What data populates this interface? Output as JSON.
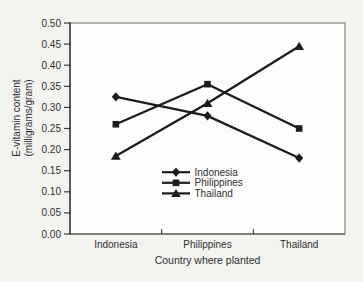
{
  "chart_data": {
    "type": "line",
    "title": "",
    "categories": [
      "Indonesia",
      "Philippines",
      "Thailand"
    ],
    "series": [
      {
        "name": "Indonesia",
        "marker": "diamond",
        "values": [
          0.325,
          0.28,
          0.18
        ]
      },
      {
        "name": "Philippines",
        "marker": "square",
        "values": [
          0.26,
          0.355,
          0.25
        ]
      },
      {
        "name": "Thailand",
        "marker": "triangle",
        "values": [
          0.185,
          0.31,
          0.445
        ]
      }
    ],
    "xlabel": "Country where planted",
    "ylabel_lines": [
      "E-vitamin content",
      "(milligrams/gram)"
    ],
    "ylim": [
      0.0,
      0.5
    ],
    "ytick_step": 0.05,
    "ytick_labels": [
      "0.50",
      "0.45",
      "0.40",
      "0.35",
      "0.30",
      "0.25",
      "0.20",
      "0.15",
      "0.10",
      "0.05",
      "0.00"
    ],
    "grid": false,
    "legend": {
      "position": "inside-bottom-center",
      "entries": [
        {
          "label": "Indonesia",
          "marker": "diamond"
        },
        {
          "label": "Philippines",
          "marker": "square"
        },
        {
          "label": "Thailand",
          "marker": "triangle"
        }
      ]
    },
    "colors": {
      "series_line": "#1c1c1c",
      "frame": "#8f8f8f",
      "axis": "#3c3c3c",
      "text": "#2f2f2f",
      "page_background": "#f3f3f0",
      "plot_background": "#fdfdfc"
    }
  }
}
